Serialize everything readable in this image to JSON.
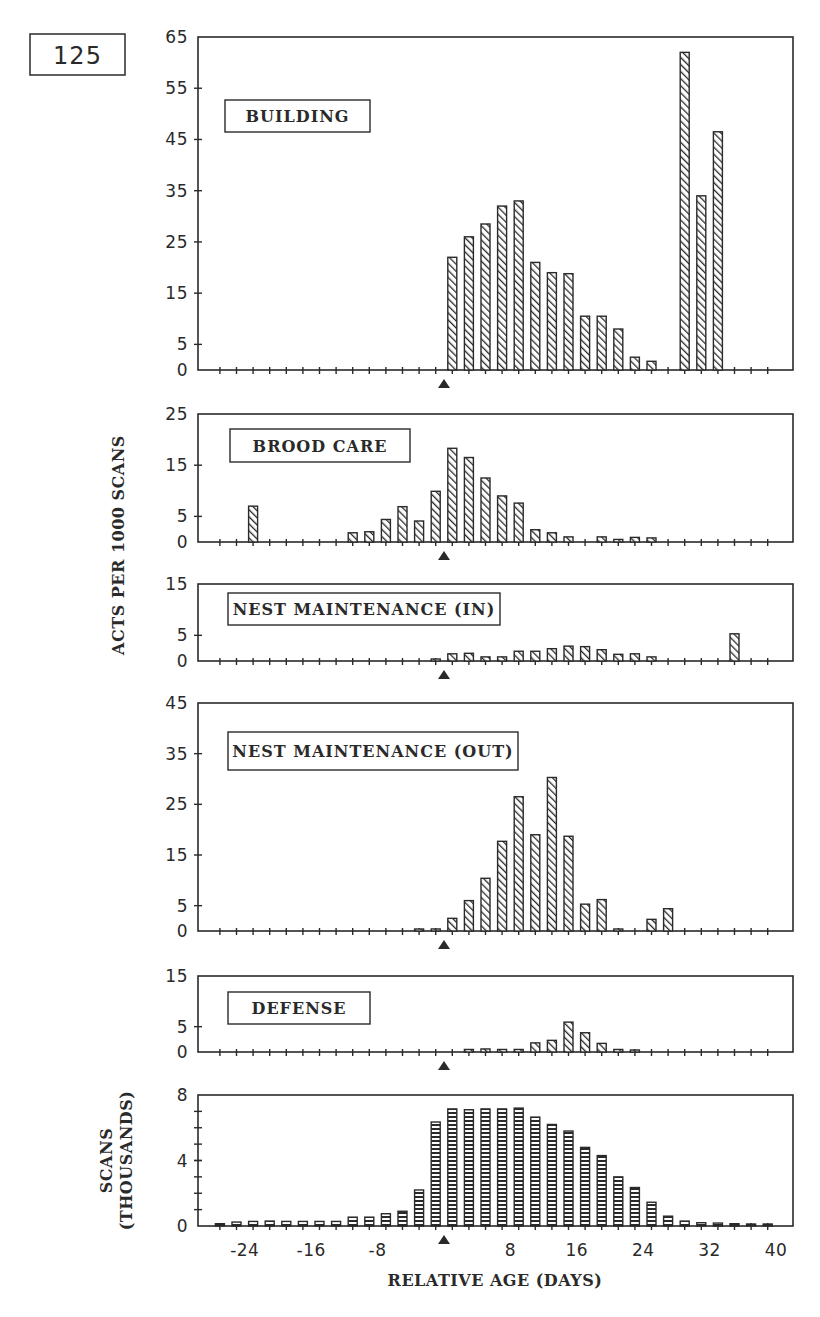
{
  "figure": {
    "number": "125",
    "shared_ylabel": "ACTS PER 1000 SCANS",
    "marker": "triangle-up at relative age 0",
    "colors": {
      "ink": "#2a2a2a",
      "bar_fill": "#ffffff",
      "background": "#ffffff"
    }
  },
  "chart_data": [
    {
      "type": "bar",
      "title": "BUILDING",
      "xlabel": "RELATIVE AGE (DAYS)",
      "ylabel": "ACTS PER 1000 SCANS",
      "ylim": [
        0,
        65
      ],
      "yticks": [
        0,
        5,
        15,
        25,
        35,
        45,
        55,
        65
      ],
      "x": [
        -27,
        -25,
        -23,
        -21,
        -19,
        -17,
        -15,
        -13,
        -11,
        -9,
        -7,
        -5,
        -3,
        -1,
        1,
        3,
        5,
        7,
        9,
        11,
        13,
        15,
        17,
        19,
        21,
        23,
        25,
        27,
        29,
        31,
        33,
        35,
        37,
        39
      ],
      "values": [
        0,
        0,
        0,
        0,
        0,
        0,
        0,
        0,
        0,
        0,
        0,
        0,
        0,
        0,
        22,
        26,
        28.5,
        32,
        33,
        21,
        19,
        18.8,
        10.5,
        10.5,
        8,
        2.5,
        1.7,
        0,
        62,
        34,
        46.5,
        0,
        0,
        0
      ],
      "hatch": "diagonal",
      "grid": false
    },
    {
      "type": "bar",
      "title": "BROOD CARE",
      "xlabel": "RELATIVE AGE (DAYS)",
      "ylabel": "ACTS PER 1000 SCANS",
      "ylim": [
        0,
        25
      ],
      "yticks": [
        0,
        5,
        15,
        25
      ],
      "x": [
        -27,
        -25,
        -23,
        -21,
        -19,
        -17,
        -15,
        -13,
        -11,
        -9,
        -7,
        -5,
        -3,
        -1,
        1,
        3,
        5,
        7,
        9,
        11,
        13,
        15,
        17,
        19,
        21,
        23,
        25,
        27,
        29,
        31,
        33,
        35,
        37,
        39
      ],
      "values": [
        0,
        0,
        7,
        0,
        0,
        0,
        0,
        0,
        1.8,
        2,
        4.4,
        6.9,
        4.1,
        9.9,
        18.3,
        16.5,
        12.5,
        9,
        7.6,
        2.4,
        1.8,
        1,
        0,
        1,
        0.5,
        0.9,
        0.8,
        0,
        0,
        0,
        0,
        0,
        0,
        0
      ],
      "hatch": "diagonal",
      "grid": false
    },
    {
      "type": "bar",
      "title": "NEST MAINTENANCE (IN)",
      "xlabel": "RELATIVE AGE (DAYS)",
      "ylabel": "ACTS PER 1000 SCANS",
      "ylim": [
        0,
        15
      ],
      "yticks": [
        0,
        5,
        15
      ],
      "x": [
        -27,
        -25,
        -23,
        -21,
        -19,
        -17,
        -15,
        -13,
        -11,
        -9,
        -7,
        -5,
        -3,
        -1,
        1,
        3,
        5,
        7,
        9,
        11,
        13,
        15,
        17,
        19,
        21,
        23,
        25,
        27,
        29,
        31,
        33,
        35,
        37,
        39
      ],
      "values": [
        0,
        0,
        0,
        0,
        0,
        0,
        0,
        0,
        0,
        0,
        0,
        0,
        0,
        0.3,
        1.4,
        1.5,
        0.8,
        0.8,
        1.9,
        1.9,
        2.4,
        2.9,
        2.8,
        2.2,
        1.3,
        1.4,
        0.8,
        0,
        0,
        0,
        0,
        5.3,
        0,
        0
      ],
      "hatch": "diagonal",
      "grid": false
    },
    {
      "type": "bar",
      "title": "NEST MAINTENANCE (OUT)",
      "xlabel": "RELATIVE AGE (DAYS)",
      "ylabel": "ACTS PER 1000 SCANS",
      "ylim": [
        0,
        45
      ],
      "yticks": [
        0,
        5,
        15,
        25,
        35,
        45
      ],
      "x": [
        -27,
        -25,
        -23,
        -21,
        -19,
        -17,
        -15,
        -13,
        -11,
        -9,
        -7,
        -5,
        -3,
        -1,
        1,
        3,
        5,
        7,
        9,
        11,
        13,
        15,
        17,
        19,
        21,
        23,
        25,
        27,
        29,
        31,
        33,
        35,
        37,
        39
      ],
      "values": [
        0,
        0,
        0,
        0,
        0,
        0,
        0,
        0,
        0,
        0,
        0,
        0,
        0.3,
        0.4,
        2.5,
        6,
        10.4,
        17.7,
        26.5,
        19,
        30.3,
        18.7,
        5.3,
        6.2,
        0.3,
        0,
        2.3,
        4.4,
        0,
        0,
        0,
        0,
        0,
        0
      ],
      "hatch": "diagonal",
      "grid": false
    },
    {
      "type": "bar",
      "title": "DEFENSE",
      "xlabel": "RELATIVE AGE (DAYS)",
      "ylabel": "ACTS PER 1000 SCANS",
      "ylim": [
        0,
        15
      ],
      "yticks": [
        0,
        5,
        15
      ],
      "x": [
        -27,
        -25,
        -23,
        -21,
        -19,
        -17,
        -15,
        -13,
        -11,
        -9,
        -7,
        -5,
        -3,
        -1,
        1,
        3,
        5,
        7,
        9,
        11,
        13,
        15,
        17,
        19,
        21,
        23,
        25,
        27,
        29,
        31,
        33,
        35,
        37,
        39
      ],
      "values": [
        0,
        0,
        0,
        0,
        0,
        0,
        0,
        0,
        0,
        0,
        0,
        0,
        0,
        0,
        0,
        0.5,
        0.6,
        0.5,
        0.5,
        1.8,
        2.3,
        5.9,
        3.8,
        1.7,
        0.5,
        0.3,
        0,
        0,
        0,
        0,
        0,
        0,
        0,
        0
      ],
      "hatch": "diagonal",
      "grid": false
    },
    {
      "type": "bar",
      "title": "",
      "xlabel": "RELATIVE AGE (DAYS)",
      "ylabel": "SCANS (THOUSANDS)",
      "ylim": [
        0,
        8
      ],
      "yticks": [
        0,
        4,
        8
      ],
      "yminor_step": 1,
      "x": [
        -27,
        -25,
        -23,
        -21,
        -19,
        -17,
        -15,
        -13,
        -11,
        -9,
        -7,
        -5,
        -3,
        -1,
        1,
        3,
        5,
        7,
        9,
        11,
        13,
        15,
        17,
        19,
        21,
        23,
        25,
        27,
        29,
        31,
        33,
        35,
        37,
        39
      ],
      "values": [
        0.14,
        0.24,
        0.28,
        0.3,
        0.28,
        0.28,
        0.28,
        0.28,
        0.54,
        0.54,
        0.75,
        0.9,
        2.2,
        6.35,
        7.15,
        7.1,
        7.15,
        7.15,
        7.2,
        6.65,
        6.2,
        5.8,
        4.8,
        4.3,
        3.0,
        2.35,
        1.45,
        0.6,
        0.3,
        0.2,
        0.18,
        0.14,
        0.04,
        0.02
      ],
      "xticks": [
        -24,
        -16,
        -8,
        8,
        16,
        24,
        32,
        40
      ],
      "xlim": [
        -29.6,
        42
      ],
      "hatch": "horizontal",
      "grid": false
    }
  ],
  "layout": {
    "plot_left": 198,
    "plot_right": 793,
    "zero_day_x": 444,
    "px_per_day": 8.3,
    "bar_width": 9,
    "panels": [
      {
        "top": 37,
        "zero": 370,
        "label_box": [
          225,
          100,
          145,
          32
        ]
      },
      {
        "top": 414,
        "zero": 542,
        "label_box": [
          230,
          429,
          180,
          33
        ]
      },
      {
        "top": 584,
        "zero": 661,
        "label_box": [
          228,
          593,
          272,
          32
        ]
      },
      {
        "top": 703,
        "zero": 931,
        "label_box": [
          228,
          732,
          290,
          38
        ]
      },
      {
        "top": 976,
        "zero": 1052,
        "label_box": [
          228,
          992,
          142,
          32
        ]
      },
      {
        "top": 1095,
        "zero": 1226,
        "label_box": null
      }
    ],
    "fig_box": [
      30,
      34,
      95,
      41
    ]
  }
}
